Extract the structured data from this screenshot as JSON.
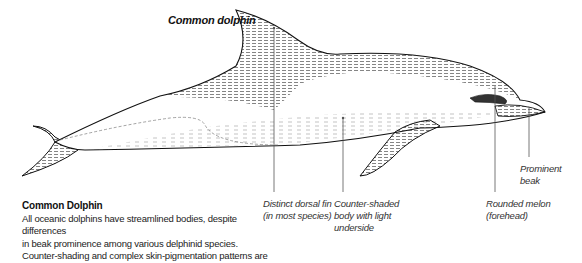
{
  "figure": {
    "title": "Common dolphin"
  },
  "annotations": [
    {
      "id": "dorsal-fin",
      "lines": [
        "Distinct dorsal fin",
        "(in most species)"
      ]
    },
    {
      "id": "counter-shaded-body",
      "lines": [
        "Counter-shaded",
        "body with light",
        "underside"
      ]
    },
    {
      "id": "rounded-melon",
      "lines": [
        "Rounded melon",
        "(forehead)"
      ]
    },
    {
      "id": "prominent-beak",
      "lines": [
        "Prominent",
        "beak"
      ]
    }
  ],
  "caption": {
    "heading": "Common Dolphin",
    "lines": [
      "All oceanic dolphins have streamlined bodies, despite differences",
      "in beak prominence among various delphinid species.",
      "Counter-shading and complex skin-pigmentation patterns are"
    ]
  },
  "colors": {
    "ink": "#1a1a1a",
    "leader_line": "#555555",
    "background": "#ffffff"
  }
}
